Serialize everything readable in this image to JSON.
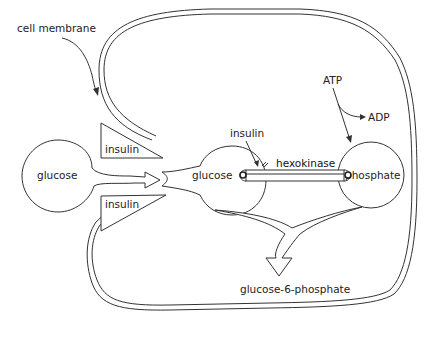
{
  "diagram": {
    "labels": {
      "cell_membrane": "cell membrane",
      "glucose_outside": "glucose",
      "glucose_inside": "glucose",
      "insulin_top": "insulin",
      "insulin_bottom": "insulin",
      "insulin_enzyme": "insulin",
      "hexokinase": "hexokinase",
      "phosphate": "phosphate",
      "atp": "ATP",
      "adp": "ADP",
      "product": "glucose-6-phosphate"
    },
    "nodes": [
      {
        "id": "glucose_outside",
        "label": "glucose",
        "shape": "circle"
      },
      {
        "id": "glucose_inside",
        "label": "glucose",
        "shape": "circle"
      },
      {
        "id": "phosphate",
        "label": "phosphate",
        "shape": "circle"
      },
      {
        "id": "insulin_top",
        "label": "insulin",
        "shape": "triangle"
      },
      {
        "id": "insulin_bottom",
        "label": "insulin",
        "shape": "triangle"
      },
      {
        "id": "hexokinase",
        "label": "hexokinase",
        "shape": "bar"
      },
      {
        "id": "product",
        "label": "glucose-6-phosphate",
        "shape": "text"
      }
    ],
    "edges": [
      {
        "from": "glucose_outside",
        "to": "glucose_inside",
        "type": "transport-arrow"
      },
      {
        "from": "atp",
        "to": "adp",
        "type": "arrow"
      },
      {
        "from": "atp",
        "to": "phosphate",
        "type": "arrow"
      },
      {
        "from": "insulin_enzyme",
        "to": "hexokinase",
        "type": "arrow"
      },
      {
        "from": "glucose_inside",
        "to": "product",
        "type": "merge-arrow"
      },
      {
        "from": "phosphate",
        "to": "product",
        "type": "merge-arrow"
      },
      {
        "from": "cell_membrane",
        "to": "membrane",
        "type": "pointer"
      }
    ],
    "colors": {
      "stroke": "#333333",
      "background": "#ffffff",
      "text": "#222222"
    }
  }
}
